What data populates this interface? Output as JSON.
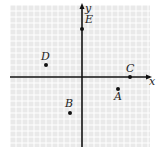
{
  "diagram": {
    "type": "coordinate-plane",
    "axes": {
      "x_label": "x",
      "y_label": "y"
    },
    "grid": {
      "unit_px": 12,
      "origin_px": [
        82,
        77
      ],
      "xmin": -6,
      "xmax": 6,
      "ymin": -6,
      "ymax": 6,
      "bg": "#e9e9e9",
      "line": "#ffffff"
    },
    "points": [
      {
        "label": "A",
        "x": 3,
        "y": -1
      },
      {
        "label": "B",
        "x": -1,
        "y": -3
      },
      {
        "label": "C",
        "x": 4,
        "y": 0
      },
      {
        "label": "D",
        "x": -3,
        "y": 1
      },
      {
        "label": "E",
        "x": 0,
        "y": 4
      }
    ]
  }
}
